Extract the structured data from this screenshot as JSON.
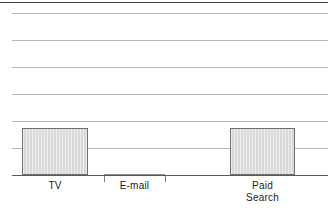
{
  "figure": {
    "width": 328,
    "height": 216,
    "background": "#ffffff",
    "top_rule_color": "#4a4a4a",
    "grid_color": "#b7b7b7",
    "axis_color": "#5a5a5a",
    "bar_fill": "#d9d9d9",
    "bar_stroke": "#6e6e6e"
  },
  "chart_data": {
    "type": "bar",
    "title": "",
    "subtitle": "",
    "xlabel": "",
    "ylabel": "",
    "categories": [
      "TV",
      "E-mail",
      "Paid\nSearch"
    ],
    "category_labels": [
      {
        "id": "tv",
        "text": "TV"
      },
      {
        "id": "email",
        "text": "E-mail"
      },
      {
        "id": "paid-search",
        "text": "Paid\nSearch"
      }
    ],
    "values": [
      1.75,
      0,
      1.75
    ],
    "ylim": [
      0,
      6
    ],
    "yticks": [
      0,
      1,
      2,
      3,
      4,
      5,
      6
    ],
    "ytick_labels": [
      "",
      "",
      "",
      "",
      "",
      "",
      ""
    ],
    "grid": true,
    "grid_axis": "y",
    "legend": false,
    "legend_position": "none",
    "annotations": [],
    "bars": [
      {
        "name": "bar-tv",
        "category": "TV",
        "value": 1.75,
        "x_left_px": 22,
        "x_right_px": 88,
        "top_px": 128,
        "bottom_px": 175
      },
      {
        "name": "bar-email",
        "category": "E-mail",
        "value": 0,
        "x_left_px": 104,
        "x_right_px": 165,
        "top_px": 175,
        "bottom_px": 175
      },
      {
        "name": "bar-paid-search",
        "category": "Paid Search",
        "value": 1.75,
        "x_left_px": 230,
        "x_right_px": 295,
        "top_px": 128,
        "bottom_px": 175
      }
    ],
    "gridlines_px": [
      13,
      40,
      67,
      94,
      121,
      148
    ],
    "axis_px": 175,
    "ticks_px": [
      104,
      165
    ]
  }
}
